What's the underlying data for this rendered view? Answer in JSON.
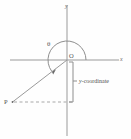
{
  "figure": {
    "background_color": "#fefefe",
    "stroke_color": "#8c8c8c",
    "text_color": "#4a4a4a"
  },
  "axes": {
    "x_label": "x",
    "y_label": "y",
    "origin_label": "O",
    "x_axis": {
      "x1": 10,
      "y1": 60,
      "x2": 119,
      "y2": 60
    },
    "y_axis": {
      "x1": 67,
      "y1": 5,
      "x2": 67,
      "y2": 136
    }
  },
  "angle": {
    "label": "θ",
    "value_degrees": 217,
    "direction": "counterclockwise",
    "start_degrees": 0,
    "arc_radius": 19,
    "arrowhead": true
  },
  "point": {
    "label": "P",
    "x": 12,
    "y": 102,
    "quadrant": 3
  },
  "ray": {
    "from": "O",
    "to": "P"
  },
  "measure": {
    "label": "y-coordinate",
    "label_italic_part": "y",
    "label_rest": "-coordinate",
    "bracket_top": 62,
    "bracket_bottom": 102,
    "bracket_x": 73
  },
  "dashed_line": {
    "from_x": 13,
    "to_x": 72,
    "y": 102,
    "style": "dashed"
  }
}
